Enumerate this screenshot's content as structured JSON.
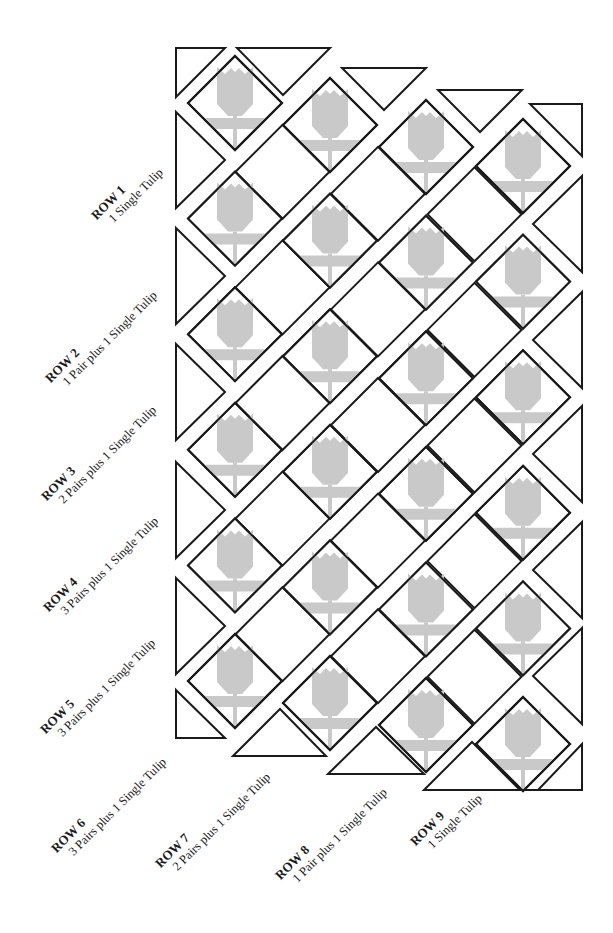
{
  "diagram": {
    "type": "quilt-assembly-diagram",
    "colors": {
      "outline": "#1a1a1a",
      "tulip_fill": "#c9c9c9",
      "background": "#ffffff"
    },
    "block": {
      "half_diagonal": 47,
      "tulip_columns_x": [
        235,
        330,
        426,
        523
      ],
      "tulip_columns_first_y": [
        103,
        125,
        147,
        166
      ],
      "vertical_spacing": 115.6,
      "tulips_per_column": 6
    },
    "rows": [
      {
        "title": "ROW 1",
        "description": "1 Single Tulip",
        "x": 88,
        "y": 212
      },
      {
        "title": "ROW 2",
        "description": "1 Pair plus 1 Single Tulip",
        "x": 42,
        "y": 375
      },
      {
        "title": "ROW 3",
        "description": "2 Pairs plus 1 Single Tulip",
        "x": 38,
        "y": 493
      },
      {
        "title": "ROW 4",
        "description": "3 Pairs plus 1 Single Tulip",
        "x": 40,
        "y": 604
      },
      {
        "title": "ROW 5",
        "description": "3 Pairs plus 1 Single Tulip",
        "x": 37,
        "y": 726
      },
      {
        "title": "ROW 6",
        "description": "3 Pairs plus 1 Single Tulip",
        "x": 48,
        "y": 845
      },
      {
        "title": "ROW 7",
        "description": "2 Pairs plus 1 Single Tulip",
        "x": 152,
        "y": 860
      },
      {
        "title": "ROW 8",
        "description": "1 Pair plus 1 Single Tulip",
        "x": 272,
        "y": 872
      },
      {
        "title": "ROW 9",
        "description": "1 Single Tulip",
        "x": 407,
        "y": 838
      }
    ],
    "edge_triangles": {
      "left": [
        [
          176,
          48,
          225,
          48,
          176,
          97
        ],
        [
          176,
          112,
          225,
          160,
          176,
          208
        ],
        [
          176,
          228,
          225,
          276,
          176,
          324
        ],
        [
          176,
          344,
          225,
          392,
          176,
          440
        ],
        [
          176,
          462,
          225,
          510,
          176,
          558
        ],
        [
          176,
          578,
          225,
          626,
          176,
          674
        ],
        [
          176,
          690,
          225,
          738,
          176,
          738
        ]
      ],
      "top": [
        [
          237,
          48,
          330,
          48,
          283,
          95
        ],
        [
          342,
          68,
          426,
          68,
          384,
          110
        ],
        [
          438,
          90,
          522,
          90,
          480,
          132
        ],
        [
          530,
          104,
          582,
          104,
          582,
          156
        ]
      ],
      "right": [
        [
          582,
          176,
          533,
          224,
          582,
          272
        ],
        [
          582,
          292,
          533,
          340,
          582,
          388
        ],
        [
          582,
          406,
          533,
          454,
          582,
          502
        ],
        [
          582,
          522,
          533,
          570,
          582,
          618
        ],
        [
          582,
          628,
          533,
          676,
          582,
          724
        ],
        [
          582,
          744,
          538,
          790,
          582,
          790
        ]
      ],
      "bottom": [
        [
          233,
          756,
          280,
          709,
          326,
          756
        ],
        [
          328,
          774,
          376,
          727,
          424,
          774
        ],
        [
          424,
          790,
          472,
          742,
          520,
          790
        ],
        [
          520,
          790,
          553,
          790,
          553,
          790
        ]
      ]
    }
  }
}
